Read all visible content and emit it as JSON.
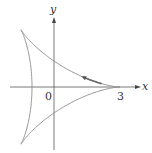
{
  "figure": {
    "type": "parametric-curve",
    "curve_name": "deltoid",
    "equations": {
      "x": "2cos t + cos 2t",
      "y": "2sin t - sin 2t"
    },
    "axes": {
      "x_label": "x",
      "y_label": "y"
    },
    "tick_labels": {
      "origin": "0",
      "x_tick": "3"
    },
    "direction_arrow": "counterclockwise, on upper branch pointing toward upper-left",
    "colors": {
      "curve": "#8a8a8a",
      "axes": "#555555",
      "arrow": "#666666"
    }
  }
}
